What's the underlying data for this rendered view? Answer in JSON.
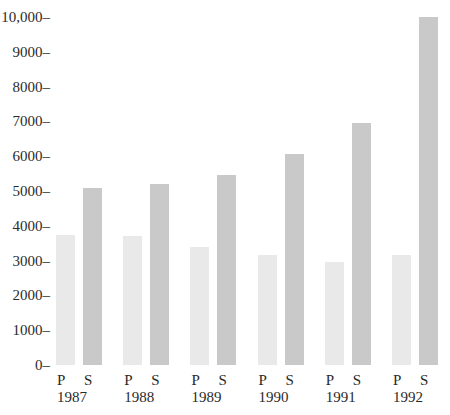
{
  "chart_data": {
    "type": "bar",
    "title": "",
    "xlabel": "",
    "ylabel": "",
    "categories": [
      "1987",
      "1988",
      "1989",
      "1990",
      "1991",
      "1992"
    ],
    "series": [
      {
        "name": "P",
        "values": [
          3750,
          3700,
          3400,
          3150,
          2950,
          3150
        ],
        "color": "#e9e9e9"
      },
      {
        "name": "S",
        "values": [
          5100,
          5200,
          5450,
          6050,
          6950,
          10000
        ],
        "color": "#c9c9c9"
      }
    ],
    "ylim": [
      0,
      10000
    ],
    "yticks": [
      0,
      1000,
      2000,
      3000,
      4000,
      5000,
      6000,
      7000,
      8000,
      9000,
      10000
    ],
    "ytick_labels": [
      "0–",
      "1000–",
      "2000–",
      "3000–",
      "4000–",
      "5000–",
      "6000–",
      "7000–",
      "8000–",
      "9000–",
      "10,000–"
    ],
    "grid": false,
    "legend": "none (series labels P and S shown under each bar)"
  }
}
